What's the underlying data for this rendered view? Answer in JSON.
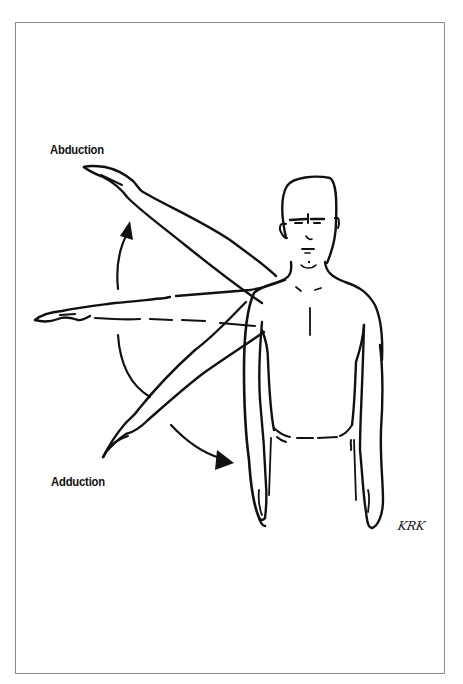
{
  "figure": {
    "labels": {
      "top": "Abduction",
      "bottom": "Adduction"
    },
    "signature": "KRK",
    "arrows": [
      {
        "name": "abduction-arrow",
        "direction": "up"
      },
      {
        "name": "adduction-arrow",
        "direction": "down"
      }
    ],
    "arm_positions": [
      "raised-diagonal",
      "horizontal",
      "lowered-diagonal",
      "at-side"
    ],
    "colors": {
      "ink": "#111111",
      "frame": "#8a8a8a",
      "background": "#ffffff"
    }
  }
}
